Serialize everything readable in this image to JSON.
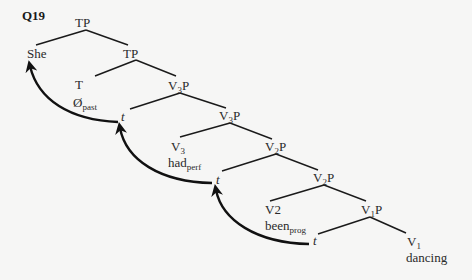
{
  "question_label": "Q19",
  "tree": {
    "nodes": [
      {
        "id": "tp1",
        "label": "TP"
      },
      {
        "id": "she",
        "label": "She"
      },
      {
        "id": "tp2",
        "label": "TP"
      },
      {
        "id": "t_head",
        "label": "T",
        "word": "Ø",
        "word_sub": "past"
      },
      {
        "id": "v3p1",
        "label": "V",
        "label_sub": "3",
        "label_tail": "P"
      },
      {
        "id": "trace1",
        "label": "t"
      },
      {
        "id": "v3p2",
        "label": "V",
        "label_sub": "3",
        "label_tail": "P"
      },
      {
        "id": "v3_head",
        "label": "V",
        "label_sub": "3",
        "word": "had",
        "word_sub": "perf"
      },
      {
        "id": "v2p1",
        "label": "V",
        "label_sub": "2",
        "label_tail": "P"
      },
      {
        "id": "trace2",
        "label": "t"
      },
      {
        "id": "v2p2",
        "label": "V",
        "label_sub": "2",
        "label_tail": "P"
      },
      {
        "id": "v2_head",
        "label": "V2",
        "word": "been",
        "word_sub": "prog"
      },
      {
        "id": "v1p",
        "label": "V",
        "label_sub": "1",
        "label_tail": "P"
      },
      {
        "id": "trace3",
        "label": "t"
      },
      {
        "id": "v1_head",
        "label": "V",
        "label_sub": "1",
        "word": "dancing"
      }
    ],
    "movements": [
      {
        "from": "trace1",
        "to": "she"
      },
      {
        "from": "trace2",
        "to": "trace1"
      },
      {
        "from": "trace3",
        "to": "trace2"
      }
    ]
  }
}
